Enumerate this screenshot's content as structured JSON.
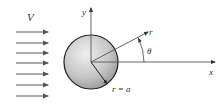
{
  "diagram": {
    "labels": {
      "velocity": "V",
      "y_axis": "y",
      "x_axis": "x",
      "radial": "r",
      "angle": "θ",
      "radius": "r = a"
    },
    "flow_arrows": {
      "count": 7,
      "x_start": 16,
      "x_end": 48,
      "y_positions": [
        32,
        43,
        53,
        63,
        74,
        85,
        96
      ]
    },
    "sphere": {
      "cx": 91,
      "cy": 62,
      "r": 27
    },
    "colors": {
      "arrow": "#666666",
      "axis": "#555555",
      "sphere_light": "#e8e8e8",
      "sphere_dark": "#9a9a9a",
      "sphere_stroke": "#222222",
      "text": "#333333"
    }
  }
}
